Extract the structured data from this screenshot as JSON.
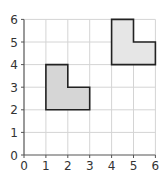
{
  "chart_data": {
    "type": "coordinate-grid",
    "title": "",
    "xlabel": "",
    "ylabel": "",
    "xlim": [
      0,
      6
    ],
    "ylim": [
      0,
      6
    ],
    "grid": true,
    "x_ticks": [
      "0",
      "1",
      "2",
      "3",
      "4",
      "5",
      "6"
    ],
    "y_ticks": [
      "0",
      "1",
      "2",
      "3",
      "4",
      "5",
      "6"
    ],
    "shapes": [
      {
        "name": "L-shape original",
        "fill": "#d6d6d6",
        "stroke": "#222222",
        "vertices": [
          [
            1,
            2
          ],
          [
            1,
            4
          ],
          [
            2,
            4
          ],
          [
            2,
            3
          ],
          [
            3,
            3
          ],
          [
            3,
            2
          ]
        ]
      },
      {
        "name": "L-shape translated",
        "fill": "#e6e6e6",
        "stroke": "#222222",
        "vertices": [
          [
            4,
            4
          ],
          [
            4,
            6
          ],
          [
            5,
            6
          ],
          [
            5,
            5
          ],
          [
            6,
            5
          ],
          [
            6,
            4
          ]
        ]
      }
    ]
  },
  "colors": {
    "grid": "#d4d4d4",
    "axis": "#555555"
  }
}
